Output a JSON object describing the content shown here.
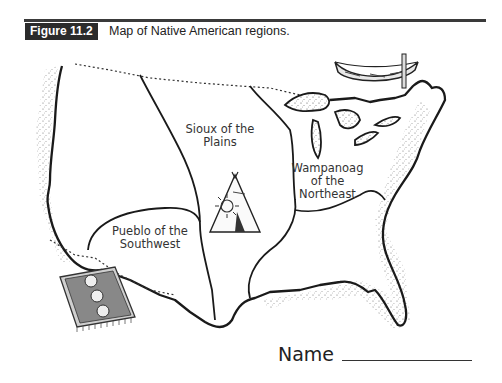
{
  "figure": {
    "label": "Figure 11.2",
    "caption": "Map of Native American regions."
  },
  "map": {
    "regions": [
      {
        "id": "sioux",
        "label_line1": "Sioux of the",
        "label_line2": "Plains"
      },
      {
        "id": "wampanoag",
        "label_line1": "Wampanoag",
        "label_line2": "of the",
        "label_line3": "Northeast"
      },
      {
        "id": "pueblo",
        "label_line1": "Pueblo of the",
        "label_line2": "Southwest"
      }
    ],
    "illustrations": [
      "canoe-icon",
      "teepee-icon",
      "rug-icon"
    ]
  },
  "form": {
    "name_label": "Name"
  },
  "colors": {
    "label_bg": "#2b2b2b",
    "ink": "#222222"
  }
}
